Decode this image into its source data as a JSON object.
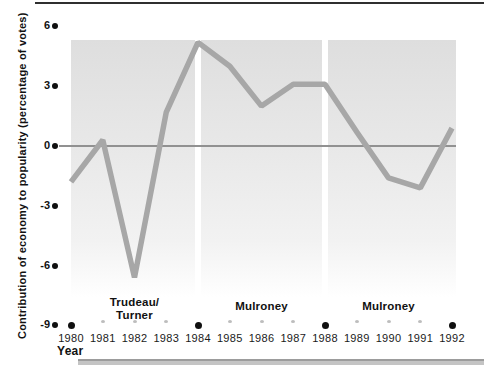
{
  "chart_data": {
    "type": "line",
    "x": [
      1980,
      1981,
      1982,
      1983,
      1984,
      1985,
      1986,
      1987,
      1988,
      1989,
      1990,
      1991,
      1992
    ],
    "values": [
      -1.8,
      0.3,
      -6.6,
      1.7,
      5.2,
      4.0,
      2.0,
      3.1,
      3.1,
      0.7,
      -1.6,
      -2.1,
      0.9
    ],
    "title": "",
    "xlabel": "Year",
    "ylabel": "Contribution of economy to popularity (percentage of votes)",
    "yticks": [
      6,
      3,
      0,
      -3,
      -6,
      -9
    ],
    "ylim": [
      -9,
      6
    ],
    "xlim": [
      1980,
      1992
    ],
    "grid": false,
    "legend": "none",
    "election_year_markers": [
      1980,
      1984,
      1988,
      1992
    ],
    "eras": [
      {
        "label_lines": [
          "Trudeau/",
          "Turner"
        ],
        "start": 1980,
        "end": 1984,
        "label_center_year": 1982
      },
      {
        "label_lines": [
          "Mulroney"
        ],
        "start": 1984,
        "end": 1988,
        "label_center_year": 1986
      },
      {
        "label_lines": [
          "Mulroney"
        ],
        "start": 1988,
        "end": 1992,
        "label_center_year": 1990
      }
    ]
  },
  "colors": {
    "trend_line": "#a7a7a7",
    "zero_line": "#919191",
    "marker_dot": "#101010",
    "minor_tick": "#bdbdbd",
    "panel_top": "#dedede",
    "panel_bottom": "#ffffff",
    "top_rule": "#2f2f2f",
    "bottom_bar_dark": "#9c9c9c",
    "bottom_bar_light": "#c4c4c4"
  }
}
